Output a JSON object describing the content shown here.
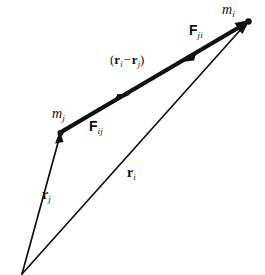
{
  "figure": {
    "background_color": "#ffffff",
    "stroke_color": "#111111",
    "labels": {
      "mass_i": {
        "symbol": "m",
        "subscript": "i"
      },
      "mass_j": {
        "symbol": "m",
        "subscript": "j"
      },
      "force_ji": {
        "symbol": "F",
        "subscript": "ji"
      },
      "force_ij": {
        "symbol": "F",
        "subscript": "ij"
      },
      "separation": {
        "open_paren": "(",
        "symbol_1": "r",
        "subscript_1": "i",
        "operator": "−",
        "symbol_2": "r",
        "subscript_2": "j",
        "close_paren": ")"
      },
      "position_i": {
        "symbol": "r",
        "subscript": "i"
      },
      "position_j": {
        "symbol": "r",
        "subscript": "j"
      }
    },
    "points": {
      "origin": {
        "x": 22,
        "y": 274
      },
      "mass_j_node": {
        "x": 60,
        "y": 133
      },
      "mass_i_node": {
        "x": 248,
        "y": 22
      }
    },
    "vectors": [
      {
        "name": "position-vector-rj",
        "label": "r_j",
        "from": "origin",
        "to": "mass_j_node",
        "style": "thin",
        "stroke_width": 1.6,
        "arrow_at": "head"
      },
      {
        "name": "position-vector-ri",
        "label": "r_i",
        "from": "origin",
        "to": "mass_i_node",
        "style": "thin",
        "stroke_width": 1.6,
        "arrow_at": "head"
      },
      {
        "name": "separation-vector",
        "label": "(r_i - r_j)",
        "from": "mass_j_node",
        "to": "mass_i_node",
        "style": "thick",
        "stroke_width": 4.0,
        "arrow_at": "head-and-midpoint"
      },
      {
        "name": "force-vector-Fji",
        "label": "F_ji",
        "from": "mass_i_node",
        "to": "mass_j_node",
        "style": "thin",
        "stroke_width": 1.6,
        "arrow_at": "reverse-midpoint"
      }
    ]
  }
}
